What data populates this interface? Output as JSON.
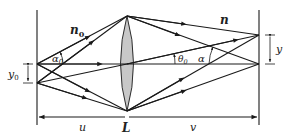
{
  "diagram": {
    "labels": {
      "n0": "n",
      "n0_sub": "0",
      "n": "n",
      "alpha0": "α",
      "alpha0_sub": "0",
      "theta0": "θ",
      "theta0_sub": "0",
      "alpha": "α",
      "y0": "y",
      "y0_sub": "0",
      "y": "y",
      "u": "u",
      "L": "L",
      "v": "v"
    },
    "colors": {
      "line": "#1a1a1a",
      "lens_fill": "#c8c8c8",
      "background": "#ffffff"
    }
  }
}
